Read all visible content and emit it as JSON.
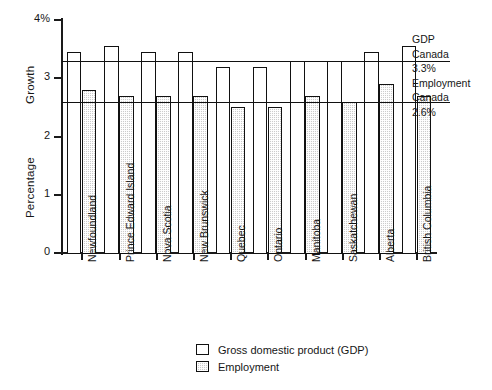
{
  "chart_data": {
    "type": "bar",
    "title": "",
    "subtitle": "",
    "xlabel": "",
    "ylabel": "Percentage Growth",
    "ylabel_lines": [
      "Percentage",
      "Growth"
    ],
    "ylim": [
      0,
      4
    ],
    "yticks": [
      0,
      1,
      2,
      3,
      4
    ],
    "ytick_labels": [
      "0",
      "1",
      "2",
      "3",
      "4%"
    ],
    "grid": false,
    "legend_position": "bottom-center",
    "categories": [
      "Newfoundland",
      "Prince Edward Island",
      "Nova Scotia",
      "New Brunswick",
      "Quebec",
      "Ontario",
      "Manitoba",
      "Saskatchewan",
      "Alberta",
      "British Columbia"
    ],
    "series": [
      {
        "name": "Gross domestic product (GDP)",
        "style": "open",
        "values": [
          3.45,
          3.55,
          3.45,
          3.45,
          3.2,
          3.2,
          3.3,
          3.3,
          3.45,
          3.55
        ]
      },
      {
        "name": "Employment",
        "style": "hatched",
        "values": [
          2.8,
          2.7,
          2.7,
          2.7,
          2.5,
          2.5,
          2.7,
          2.6,
          2.9,
          2.7
        ]
      }
    ],
    "reference_lines": [
      {
        "id": "gdp-canada",
        "value": 3.3,
        "label_lines": [
          "GDP",
          "Canada",
          "3.3%"
        ]
      },
      {
        "id": "employment-canada",
        "value": 2.6,
        "label_lines": [
          "Employment",
          "Canada",
          "2.6%"
        ]
      }
    ],
    "annotations": {
      "gdp_title": "GDP",
      "gdp_region": "Canada",
      "gdp_value": "3.3%",
      "employment_title": "Employment",
      "employment_region": "Canada",
      "employment_value": "2.6%"
    }
  },
  "legend": {
    "items": [
      {
        "label": "Gross domestic product (GDP)"
      },
      {
        "label": "Employment"
      }
    ]
  }
}
